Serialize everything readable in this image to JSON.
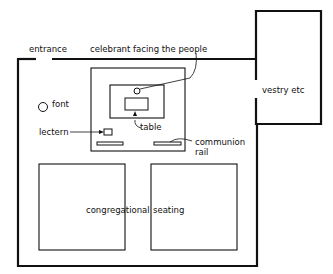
{
  "diagram": {
    "type": "church floor plan",
    "labels": {
      "entrance": "entrance",
      "celebrant": "celebrant facing the people",
      "vestry": "vestry etc",
      "font": "font",
      "table": "table",
      "lectern": "lectern",
      "communion_rail_line1": "communion",
      "communion_rail_line2": "rail",
      "seating_left": "congregational",
      "seating_right": "seating"
    },
    "colors": {
      "ink": "#111111",
      "background": "#ffffff"
    }
  }
}
